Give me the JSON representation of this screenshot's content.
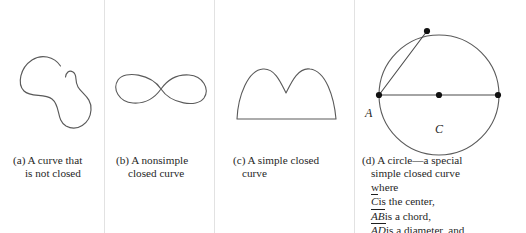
{
  "figure": {
    "kind": "textbook-figure",
    "background_color": "#ffffff",
    "stroke_color": "#5a5a5a",
    "text_color": "#1f1f1f",
    "divider_color": "#e2e2e2"
  },
  "panels": [
    {
      "key": "a",
      "drawing": "open-blob-curve",
      "caption_lines": [
        "(a) A curve that",
        "is not closed"
      ]
    },
    {
      "key": "b",
      "drawing": "figure-eight-curve",
      "caption_lines": [
        "(b) A nonsimple",
        "closed curve"
      ]
    },
    {
      "key": "c",
      "drawing": "two-humped-arch-curve",
      "caption_lines": [
        "(c) A simple closed",
        "curve"
      ]
    },
    {
      "key": "d",
      "drawing": "circle-with-chord-and-diameter",
      "caption_lines": [
        "(d) A circle—a special",
        "simple closed curve",
        "where"
      ],
      "caption_defs": [
        {
          "term": "C",
          "rest": "is the center,"
        },
        {
          "term": "AB",
          "rest": "is a chord,"
        },
        {
          "term": "AD",
          "rest": "is a diameter, and"
        }
      ]
    }
  ],
  "circle": {
    "center_label": "C",
    "point_a_label": "A",
    "points": [
      {
        "name": "A",
        "x": 24,
        "y": 75
      },
      {
        "name": "B",
        "x": 72,
        "y": 11
      },
      {
        "name": "C",
        "x": 84,
        "y": 75
      },
      {
        "name": "D",
        "x": 143,
        "y": 75
      }
    ],
    "radius": 60,
    "segments": [
      "chord-AB",
      "diameter-AD"
    ]
  }
}
